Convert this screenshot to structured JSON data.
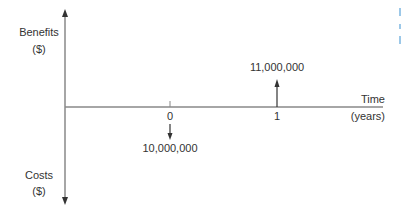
{
  "diagram": {
    "type": "cash-flow-diagram",
    "vertical_axis": {
      "positive_label": "Benefits",
      "positive_unit": "($)",
      "negative_label": "Costs",
      "negative_unit": "($)"
    },
    "horizontal_axis": {
      "label": "Time",
      "unit": "(years)",
      "ticks": [
        "0",
        "1"
      ]
    },
    "cash_flows": [
      {
        "time": "0",
        "direction": "down",
        "amount": "10,000,000",
        "type": "cost"
      },
      {
        "time": "1",
        "direction": "up",
        "amount": "11,000,000",
        "type": "benefit"
      }
    ],
    "colors": {
      "axis": "#888888",
      "text": "#333333",
      "arrow": "#333333"
    }
  }
}
